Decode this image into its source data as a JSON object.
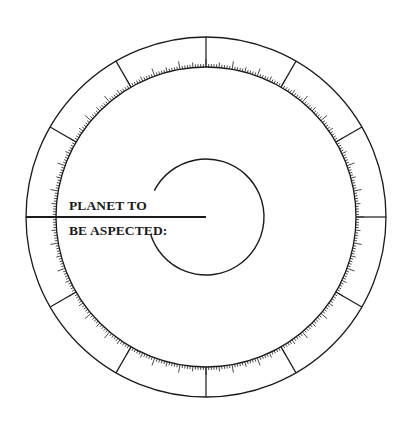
{
  "diagram": {
    "type": "aspect-wheel",
    "label_line_1": "PLANET TO",
    "label_line_2": "BE ASPECTED:",
    "colors": {
      "ink": "#1a1a1a",
      "background": "#ffffff"
    },
    "geometry": {
      "center": [
        206,
        217
      ],
      "outer_radius": 180,
      "inner_radius": 150,
      "hub_radius": 58,
      "spoke_count": 12,
      "spoke_offset_deg": 0,
      "tick_minor_len": 3,
      "tick_mid_len": 5,
      "tick_major_len": 8,
      "pointer_from_x": 26,
      "pointer_to_x": 206,
      "hub_gap_deg": [
        153,
        197
      ]
    },
    "scale": {
      "degrees": 360,
      "minor_every": 1,
      "mid_every": 5,
      "major_every": 10
    }
  }
}
